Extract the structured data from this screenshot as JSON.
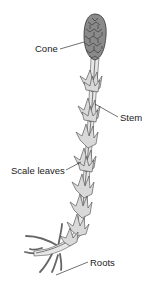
{
  "diagram": {
    "labels": {
      "cone": "Cone",
      "stem": "Stem",
      "scale_leaves": "Scale leaves",
      "roots": "Roots"
    },
    "colors": {
      "cone_fill": "#8a8a8a",
      "stem_fill": "#e6e6e6",
      "leaf_fill": "#d9d9d9",
      "outline": "#444444",
      "background": "#ffffff"
    }
  }
}
